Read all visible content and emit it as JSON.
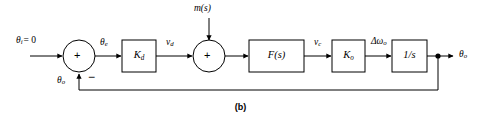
{
  "figure": {
    "caption": "(b)",
    "type": "control-system-block-diagram"
  },
  "signals": {
    "input": "θ",
    "input_sub": "i",
    "input_eq": "= 0",
    "error": "θ",
    "error_sub": "e",
    "vd": "v",
    "vd_sub": "d",
    "vc": "v",
    "vc_sub": "c",
    "delta_omega": "Δω",
    "delta_omega_sub": "o",
    "output": "θ",
    "output_sub": "o",
    "feedback": "θ",
    "feedback_sub": "o",
    "disturbance": "m(s)"
  },
  "blocks": [
    {
      "name": "phase-detector-gain",
      "label": "K",
      "sub": "d"
    },
    {
      "name": "loop-filter",
      "label": "F(s)",
      "sub": ""
    },
    {
      "name": "vco-gain",
      "label": "K",
      "sub": "o"
    },
    {
      "name": "integrator",
      "label": "1/s",
      "sub": ""
    }
  ],
  "summing_junctions": [
    {
      "name": "error-summer",
      "plus": "+",
      "minus": "−"
    },
    {
      "name": "disturbance-summer",
      "plus": "+"
    }
  ],
  "style": {
    "stroke": "#000000",
    "background": "#ffffff"
  }
}
